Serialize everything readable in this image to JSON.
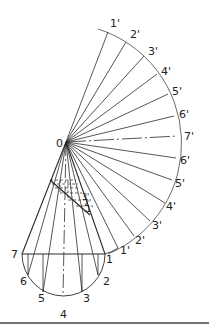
{
  "diagram": {
    "apex_label": "0",
    "colors": {
      "line": "#2b2b2b",
      "background": "#ffffff"
    },
    "development_arc_labels": [
      "1'",
      "2'",
      "3'",
      "4'",
      "5'",
      "6'",
      "7'",
      "6'",
      "5'",
      "4'",
      "3'",
      "2'",
      "1'"
    ],
    "development_inner_labels": [
      "1\"",
      "2\"",
      "3\"",
      "4\"",
      "5\"",
      "6\"",
      "7\"",
      "6\"",
      "5\"",
      "4\"",
      "3\"",
      "2\"",
      "1\""
    ],
    "base_points": [
      "7",
      "1",
      "2",
      "3",
      "4",
      "5",
      "6"
    ],
    "cut_labels": [
      "1'",
      "2'",
      "3'",
      "4'",
      "5'",
      "6'",
      "7'"
    ],
    "upper": {
      "l1": "1'",
      "l2": "2'",
      "l3": "3'",
      "l4": "4'",
      "l5": "5'",
      "l6": "6'",
      "l7": "7'",
      "r6": "6'",
      "r5": "5'",
      "r4": "4'",
      "r3": "3'",
      "r2": "2'",
      "r1": "1'"
    },
    "base": {
      "p7": "7",
      "p1": "1",
      "p2": "2",
      "p3": "3",
      "p4": "4",
      "p5": "5",
      "p6": "6"
    },
    "cut": {
      "c1": "1'",
      "c2": "2'",
      "c3": "3'"
    }
  }
}
